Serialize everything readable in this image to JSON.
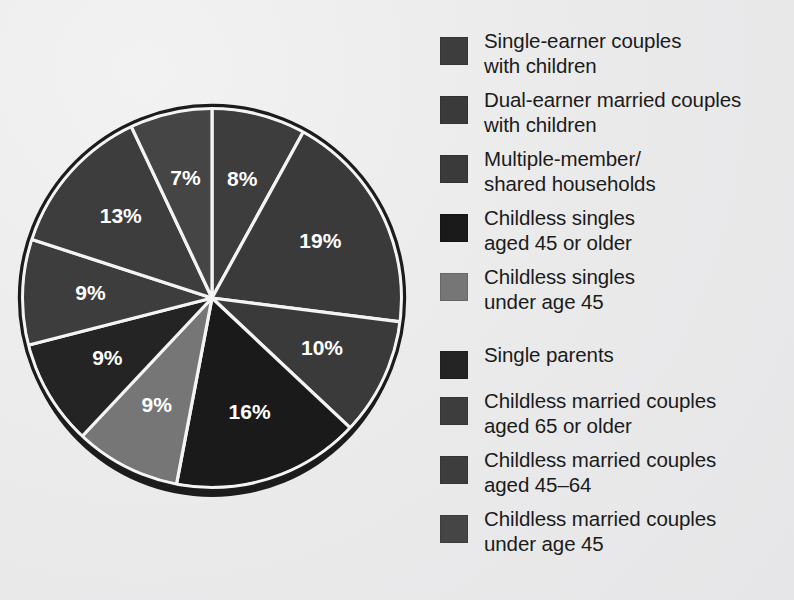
{
  "background_color": "#ececed",
  "chart_data": {
    "type": "pie",
    "title": "",
    "subtitle": "",
    "xlabel": "",
    "ylabel": "",
    "legend_position": "right",
    "grid": false,
    "start_angle_deg": 0,
    "direction": "clockwise",
    "units": "percent",
    "label_suffix": "%",
    "categories": [
      "Single-earner couples with children",
      "Dual-earner married couples with children",
      "Multiple-member/ shared households",
      "Childless singles aged 45 or older",
      "Childless singles under age 45",
      "Single parents",
      "Childless married couples aged 65 or older",
      "Childless married couples aged 45–64",
      "Childless married couples under age 45"
    ],
    "values": [
      8,
      19,
      10,
      16,
      9,
      9,
      9,
      13,
      7
    ],
    "slice_labels": [
      "8%",
      "19%",
      "10%",
      "16%",
      "9%",
      "9%",
      "9%",
      "13%",
      "7%"
    ],
    "colors": [
      "#3d3d3d",
      "#3a3a3a",
      "#3a3a3a",
      "#1a1a1a",
      "#767676",
      "#242424",
      "#3d3d3d",
      "#3d3d3d",
      "#454545"
    ],
    "label_color": "#ffffff",
    "slice_border_color": "#f4f4f4",
    "rim_color": "#1c1c1c"
  },
  "pie": {
    "center_x": 212,
    "center_y": 298,
    "radius": 190,
    "depth": 9,
    "slices": [
      {
        "label": "8%",
        "value": 8,
        "color": "#3d3d3d",
        "name": "slice-single-earner-couples-with-children"
      },
      {
        "label": "19%",
        "value": 19,
        "color": "#3a3a3a",
        "name": "slice-dual-earner-married-couples-with-children"
      },
      {
        "label": "10%",
        "value": 10,
        "color": "#3a3a3a",
        "name": "slice-multiple-member-shared-households"
      },
      {
        "label": "16%",
        "value": 16,
        "color": "#1a1a1a",
        "name": "slice-childless-singles-45-or-older"
      },
      {
        "label": "9%",
        "value": 9,
        "color": "#767676",
        "name": "slice-childless-singles-under-45"
      },
      {
        "label": "9%",
        "value": 9,
        "color": "#242424",
        "name": "slice-single-parents"
      },
      {
        "label": "9%",
        "value": 9,
        "color": "#3d3d3d",
        "name": "slice-childless-married-couples-65-or-older"
      },
      {
        "label": "13%",
        "value": 13,
        "color": "#3d3d3d",
        "name": "slice-childless-married-couples-45-64"
      },
      {
        "label": "7%",
        "value": 7,
        "color": "#454545",
        "name": "slice-childless-married-couples-under-45"
      }
    ]
  },
  "legend": {
    "items": [
      {
        "label": "Single-earner couples\nwith children",
        "color": "#3d3d3d",
        "gap_after": false,
        "name": "legend-item-single-earner-couples-with-children"
      },
      {
        "label": "Dual-earner married couples\nwith children",
        "color": "#3a3a3a",
        "gap_after": false,
        "name": "legend-item-dual-earner-married-couples-with-children"
      },
      {
        "label": "Multiple-member/\nshared households",
        "color": "#3a3a3a",
        "gap_after": false,
        "name": "legend-item-multiple-member-shared-households"
      },
      {
        "label": "Childless singles\naged 45 or older",
        "color": "#1a1a1a",
        "gap_after": false,
        "name": "legend-item-childless-singles-45-or-older"
      },
      {
        "label": "Childless singles\nunder age 45",
        "color": "#767676",
        "gap_after": true,
        "name": "legend-item-childless-singles-under-45"
      },
      {
        "label": "Single parents",
        "color": "#242424",
        "gap_after": false,
        "name": "legend-item-single-parents"
      },
      {
        "label": "Childless married couples\naged 65 or older",
        "color": "#3d3d3d",
        "gap_after": false,
        "name": "legend-item-childless-married-couples-65-or-older"
      },
      {
        "label": "Childless married couples\naged 45–64",
        "color": "#3d3d3d",
        "gap_after": false,
        "name": "legend-item-childless-married-couples-45-64"
      },
      {
        "label": "Childless married couples\nunder age 45",
        "color": "#454545",
        "gap_after": false,
        "name": "legend-item-childless-married-couples-under-45"
      }
    ]
  }
}
